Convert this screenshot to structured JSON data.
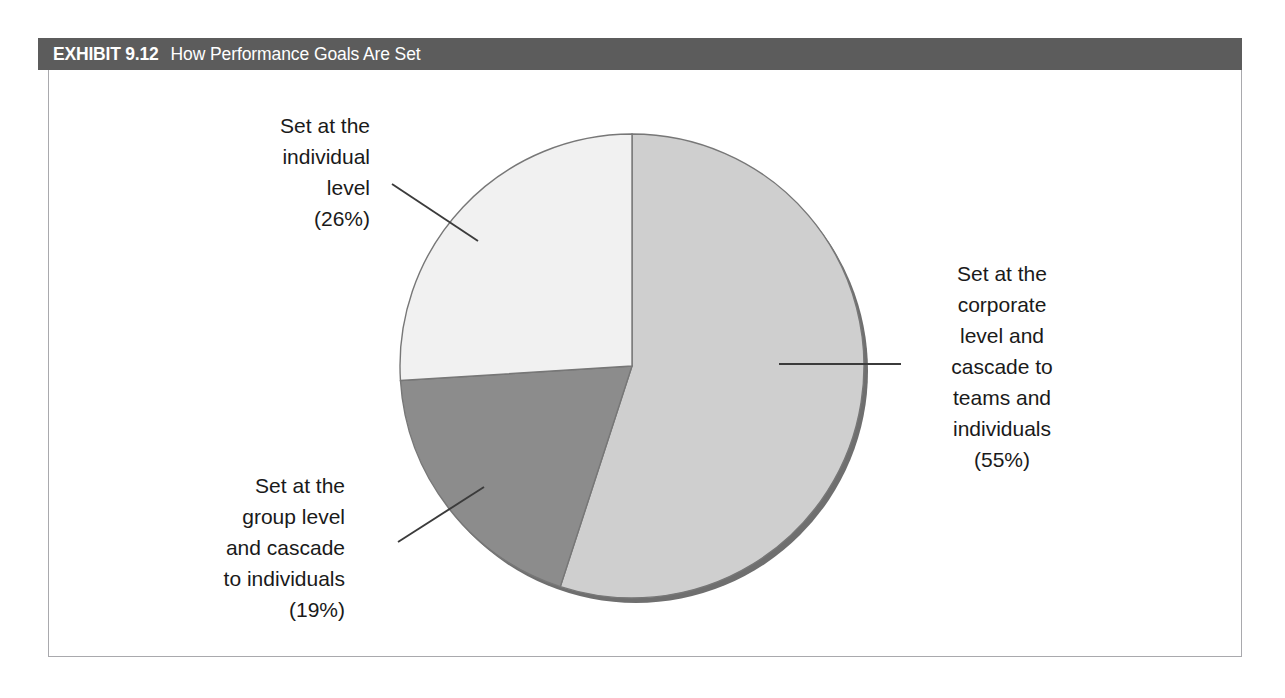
{
  "exhibit": {
    "number": "EXHIBIT 9.12",
    "title": "How Performance Goals Are Set",
    "header_bg": "#5c5c5c",
    "header_text_color": "#ffffff",
    "frame_border_color": "#a9a9ad",
    "background": "#ffffff"
  },
  "chart_data": {
    "type": "pie",
    "title": "How Performance Goals Are Set",
    "xlabel": "",
    "ylabel": "",
    "grid": false,
    "legend_position": "none",
    "labels_outside": true,
    "start_angle_deg": 0,
    "direction": "clockwise",
    "categories": [
      "Set at the corporate level and cascade to teams and individuals",
      "Set at the group level and cascade to individuals",
      "Set at the individual level"
    ],
    "values": [
      55,
      19,
      26
    ],
    "value_suffix": "%",
    "colors": [
      "#cfcfcf",
      "#8c8c8c",
      "#f1f1f1"
    ],
    "slice_edge_color": "#6b6b6b",
    "shadow_color": "#6f6f6f",
    "slices": [
      {
        "name": "corporate",
        "label": "Set at the\ncorporate\nlevel and\ncascade to\nteams and\nindividuals\n(55%)",
        "percent": 55,
        "percent_text": "(55%)",
        "color": "#cfcfcf",
        "start_deg": 0,
        "end_deg": 198
      },
      {
        "name": "group",
        "label": "Set at the\ngroup level\nand cascade\nto individuals\n(19%)",
        "percent": 19,
        "percent_text": "(19%)",
        "color": "#8c8c8c",
        "start_deg": 198,
        "end_deg": 266.4
      },
      {
        "name": "individual",
        "label": "Set at the\nindividual\nlevel\n(26%)",
        "percent": 26,
        "percent_text": "(26%)",
        "color": "#f1f1f1",
        "start_deg": 266.4,
        "end_deg": 360
      }
    ]
  }
}
